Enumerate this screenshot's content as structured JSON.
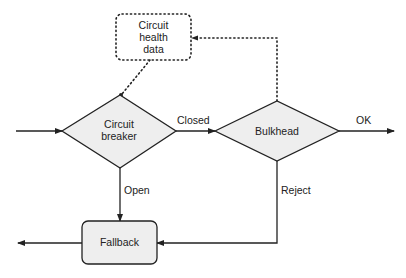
{
  "nodes": {
    "health": {
      "lines": [
        "Circuit",
        "health",
        "data"
      ]
    },
    "breaker": {
      "lines": [
        "Circuit",
        "breaker"
      ]
    },
    "bulkhead": {
      "label": "Bulkhead"
    },
    "fallback": {
      "label": "Fallback"
    }
  },
  "edges": {
    "closed": "Closed",
    "ok": "OK",
    "open": "Open",
    "reject": "Reject"
  },
  "colors": {
    "stroke": "#222222",
    "fill": "#eeeeee"
  }
}
